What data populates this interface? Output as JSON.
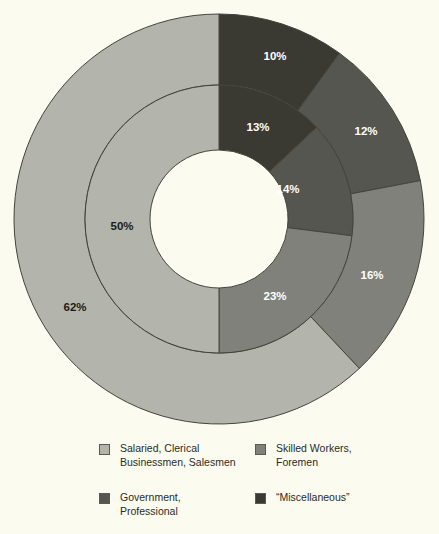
{
  "chart_data": {
    "type": "pie",
    "title": "",
    "subtitle": "",
    "variant": "nested-donut",
    "legend_position": "bottom",
    "grid": false,
    "background_color": "#fbfbef",
    "center": {
      "x": 219,
      "y": 219
    },
    "radii": {
      "hole": 69,
      "inner_ring_outer": 134,
      "outer_ring_outer": 205
    },
    "start_angle_deg": 0,
    "direction": "clockwise",
    "categories": [
      "“Miscellaneous”",
      "Government, Professional",
      "Skilled Workers, Foremen",
      "Salaried, Clerical Businessmen, Salesmen"
    ],
    "series": [
      {
        "name": "Inner ring",
        "ring": "inner",
        "values": [
          13,
          14,
          23,
          50
        ],
        "labels": [
          "13%",
          "14%",
          "23%",
          "50%"
        ]
      },
      {
        "name": "Outer ring",
        "ring": "outer",
        "values": [
          10,
          12,
          16,
          62
        ],
        "labels": [
          "10%",
          "12%",
          "16%",
          "62%"
        ]
      }
    ],
    "colors": {
      "miscellaneous": "#3a3a33",
      "government_professional": "#565650",
      "skilled_workers_foremen": "#80817a",
      "salaried_clerical": "#b3b4ab"
    },
    "label_text_colors": {
      "on_dark": "#ffffff",
      "on_light": "#1c1c17"
    },
    "slices": [
      {
        "ring": "outer",
        "label": "10%",
        "value": 10,
        "category": "“Miscellaneous”",
        "color": "#3a3a33",
        "label_color": "#ffffff",
        "label_x": 275,
        "label_y": 57
      },
      {
        "ring": "outer",
        "label": "12%",
        "value": 12,
        "category": "Government, Professional",
        "color": "#565650",
        "label_x": 366,
        "label_y": 132,
        "label_color": "#ffffff"
      },
      {
        "ring": "outer",
        "label": "16%",
        "value": 16,
        "category": "Skilled Workers, Foremen",
        "color": "#80817a",
        "label_x": 372,
        "label_y": 276,
        "label_color": "#ffffff"
      },
      {
        "ring": "outer",
        "label": "62%",
        "value": 62,
        "category": "Salaried, Clerical Businessmen, Salesmen",
        "color": "#b3b4ab",
        "label_x": 75,
        "label_y": 308,
        "label_color": "#1c1c17"
      },
      {
        "ring": "inner",
        "label": "13%",
        "value": 13,
        "category": "“Miscellaneous”",
        "color": "#3a3a33",
        "label_x": 258,
        "label_y": 128,
        "label_color": "#ffffff"
      },
      {
        "ring": "inner",
        "label": "14%",
        "value": 14,
        "category": "Government, Professional",
        "color": "#565650",
        "label_x": 288,
        "label_y": 190,
        "label_color": "#ffffff"
      },
      {
        "ring": "inner",
        "label": "23%",
        "value": 23,
        "category": "Skilled Workers, Foremen",
        "color": "#80817a",
        "label_x": 275,
        "label_y": 297,
        "label_color": "#ffffff"
      },
      {
        "ring": "inner",
        "label": "50%",
        "value": 50,
        "category": "Salaried, Clerical Businessmen, Salesmen",
        "color": "#b3b4ab",
        "label_x": 122,
        "label_y": 227,
        "label_color": "#1c1c17"
      }
    ],
    "legend": [
      {
        "label": "Salaried, Clerical\nBusinessmen, Salesmen",
        "color": "#b3b4ab"
      },
      {
        "label": "Skilled Workers,\nForemen",
        "color": "#80817a"
      },
      {
        "label": "Government,\nProfessional",
        "color": "#565650"
      },
      {
        "label": "“Miscellaneous”",
        "color": "#3a3a33"
      }
    ]
  }
}
